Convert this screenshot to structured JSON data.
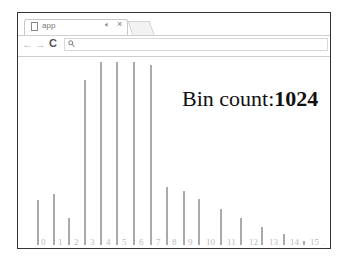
{
  "browser": {
    "tab": {
      "title": "app",
      "audio_icon": "speaker-icon",
      "close_icon": "close-icon"
    },
    "toolbar": {
      "back": "←",
      "forward": "→",
      "reload": "C",
      "search_glyph": "⚲"
    }
  },
  "page": {
    "bin_count_label": "Bin count:",
    "bin_count_value": "1024"
  },
  "chart_data": {
    "type": "bar",
    "title": "Bin count:1024",
    "categories": [
      "0",
      "1",
      "2",
      "3",
      "4",
      "5",
      "6",
      "7",
      "8",
      "9",
      "10",
      "11",
      "12",
      "13",
      "14",
      "15"
    ],
    "values": [
      45,
      51,
      27,
      165,
      183,
      183,
      183,
      180,
      58,
      54,
      46,
      36,
      27,
      18,
      11,
      4
    ],
    "value_unit": "approx pixel height (no y-axis shown)",
    "xlabel": "",
    "ylabel": "",
    "grid": false,
    "bar_color": "#aaaaaa",
    "label_color": "#bbbbbb"
  },
  "layout": {
    "bar_x": [
      19,
      35,
      50,
      66,
      82,
      98,
      115,
      132,
      148,
      165,
      180,
      202,
      222,
      243,
      265,
      285
    ],
    "label_x": [
      23,
      40,
      56,
      72,
      88,
      104,
      121,
      138,
      154,
      170,
      188,
      209,
      231,
      251,
      272,
      292
    ]
  }
}
